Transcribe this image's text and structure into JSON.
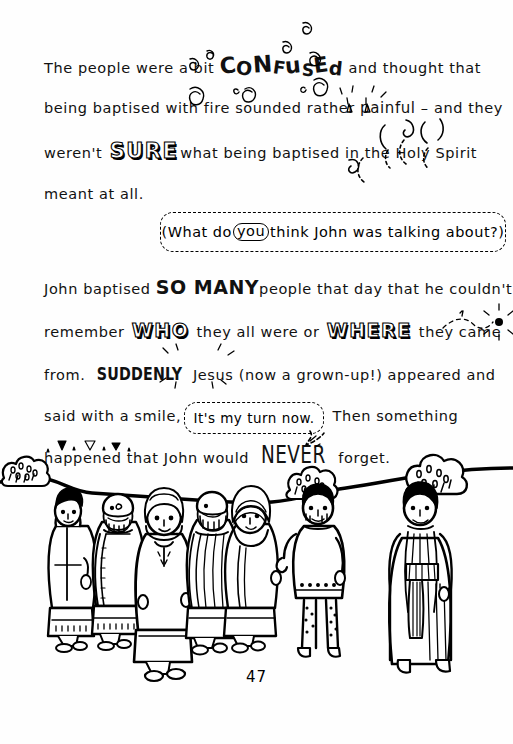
{
  "page": {
    "number": "47",
    "background_color": "#fefefe",
    "ink_color": "#000000"
  },
  "body_text": {
    "line1": {
      "before": "The people were a bit ",
      "emphasis": "CONFUSED",
      "emphasis_style": "wobbly-caps-with-spirals",
      "after": " and thought that"
    },
    "line2": {
      "before": "being baptised with fire sounded rather ",
      "emphasis": "painful",
      "emphasis_style": "small-flames",
      "after": " – and they"
    },
    "line3": {
      "before": "weren't ",
      "emphasis": "SURE",
      "emphasis_style": "outlined-3d",
      "after": "what being baptised in the Holy Spirit"
    },
    "line4": {
      "before": "meant at all.",
      "emphasis": "",
      "after": ""
    },
    "line5": {
      "before": "John baptised ",
      "emphasis": "SO MANY",
      "emphasis_style": "bold-caps",
      "after": "people that day that he couldn't"
    },
    "line6": {
      "before": "remember ",
      "emphasis": "WHO",
      "emphasis_style": "outlined-3d",
      "middle": " they all were or ",
      "emphasis2": "WHERE",
      "after": " they came"
    },
    "line7": {
      "before": "from. ",
      "emphasis": "SUDDENLY",
      "emphasis_style": "bold-with-sparkles",
      "after": " Jesus (now a grown-up!) appeared and"
    },
    "line8": {
      "before": "said with a smile,",
      "emphasis": "",
      "after": "Then something"
    },
    "line9": {
      "before": "happened that John would ",
      "emphasis": "NEVER",
      "emphasis_style": "tall-condensed-caps",
      "after": " forget."
    }
  },
  "question_box": {
    "text_before": "(What do",
    "circled_word": "you",
    "text_after": "think John was talking about?)",
    "style": "dashed-rounded-box"
  },
  "speech_bubble": {
    "text": "It's my turn now.",
    "style": "dashed-rounded-speech-bubble",
    "speaker": "Jesus"
  },
  "illustration": {
    "description": "Line-art scene of a crowd of robed people on the left and two figures on the right standing on a wavy hill horizon with bushes",
    "ground_line_label": "hill-horizon",
    "bushes": [
      {
        "name": "bush-left",
        "x": 18,
        "y": 468
      },
      {
        "name": "bush-middle",
        "x": 300,
        "y": 478
      },
      {
        "name": "bush-right",
        "x": 420,
        "y": 462
      }
    ],
    "figures": [
      {
        "name": "crowd-figure-1",
        "description": "man with dark hair in long robe"
      },
      {
        "name": "crowd-figure-2",
        "description": "bald bearded man with patterned shawl"
      },
      {
        "name": "crowd-figure-3",
        "description": "woman with head covering in pale robe"
      },
      {
        "name": "crowd-figure-4",
        "description": "bearded man in striped robe"
      },
      {
        "name": "crowd-figure-5",
        "description": "woman in striped headscarf"
      },
      {
        "name": "john-the-baptist",
        "description": "man in short tunic with bare legs"
      },
      {
        "name": "jesus",
        "description": "man in long striped robe with sash"
      }
    ]
  }
}
